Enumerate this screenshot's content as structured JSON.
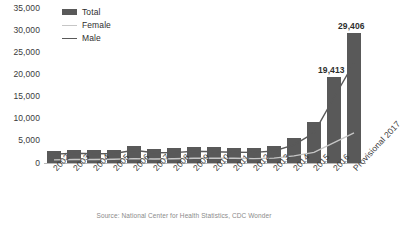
{
  "chart_data": {
    "type": "bar",
    "title": "",
    "subtitle": "",
    "xlabel": "",
    "ylabel": "",
    "ylim": [
      0,
      35000
    ],
    "ytick_labels": [
      "35,000",
      "30,000",
      "25,000",
      "20,000",
      "15,000",
      "10,000",
      "5,000",
      "0"
    ],
    "ytick_values": [
      35000,
      30000,
      25000,
      20000,
      15000,
      10000,
      5000,
      0
    ],
    "grid": false,
    "legend_position": "top-left",
    "categories": [
      "2002",
      "2003",
      "2004",
      "2005",
      "2006",
      "2007",
      "2008",
      "2009",
      "2010",
      "2011",
      "2012",
      "2013",
      "2014",
      "2015",
      "2016",
      "Provisional 2017"
    ],
    "series": [
      {
        "name": "Total",
        "render": "bar",
        "color": "#595959",
        "values": [
          2700,
          3000,
          2900,
          3000,
          3900,
          3200,
          3300,
          3700,
          3600,
          3500,
          3400,
          3800,
          5700,
          9200,
          19413,
          29406
        ]
      },
      {
        "name": "Female",
        "render": "line",
        "color": "#c6c6c6",
        "values": [
          700,
          800,
          800,
          850,
          1000,
          900,
          950,
          1050,
          1050,
          1050,
          1000,
          1100,
          1600,
          2400,
          4600,
          6800
        ]
      },
      {
        "name": "Male",
        "render": "line",
        "color": "#595959",
        "values": [
          2000,
          2200,
          2100,
          2150,
          2900,
          2300,
          2350,
          2650,
          2550,
          2450,
          2400,
          2700,
          4100,
          6800,
          14800,
          22600
        ]
      }
    ],
    "data_labels": [
      {
        "category": "2016",
        "value": 19413,
        "text": "19,413"
      },
      {
        "category": "Provisional 2017",
        "value": 29406,
        "text": "29,406"
      }
    ],
    "source_note": "Source: National Center for Health Statistics, CDC Wonder"
  },
  "legend": {
    "items": [
      {
        "label": "Total",
        "marker": "bar-swatch-icon"
      },
      {
        "label": "Female",
        "marker": "line-swatch-icon"
      },
      {
        "label": "Male",
        "marker": "line-swatch-icon"
      }
    ]
  }
}
